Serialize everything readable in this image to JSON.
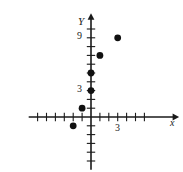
{
  "figure": {
    "kind": "scatter-plot-on-axes",
    "background_color": "#ffffff",
    "ink_color": "#1a1a1a"
  },
  "axes": {
    "x_label": "x",
    "y_label": "Y",
    "origin_px": {
      "x": 91,
      "y": 117
    },
    "unit_px": {
      "x": 8.9,
      "y": 8.8
    },
    "x_range": [
      -7,
      9
    ],
    "y_range": [
      -6,
      11
    ],
    "x_tick_labels": [
      {
        "text": "3",
        "value": 3
      }
    ],
    "y_tick_labels": [
      {
        "text": "9",
        "value": 9
      },
      {
        "text": "3",
        "value": 3
      }
    ],
    "tick_interval": 1,
    "grid": false,
    "arrowheads": [
      "x-positive",
      "y-positive"
    ]
  },
  "chart_data": {
    "type": "scatter",
    "title": "",
    "xlabel": "x",
    "ylabel": "Y",
    "xlim": [
      -7,
      9
    ],
    "ylim": [
      -6,
      11
    ],
    "xticks": [
      -6,
      -5,
      -4,
      -3,
      -2,
      -1,
      1,
      2,
      3,
      4,
      5,
      6
    ],
    "yticks": [
      -5,
      -4,
      -3,
      -2,
      -1,
      1,
      2,
      3,
      4,
      5,
      6,
      7,
      8,
      9,
      10
    ],
    "xtick_labels": {
      "3": "3"
    },
    "ytick_labels": {
      "3": "3",
      "9": "9"
    },
    "grid": false,
    "legend": null,
    "marker": "filled-circle",
    "marker_color": "#111111",
    "marker_radius_px": 3.4,
    "points": [
      {
        "x": -2,
        "y": -1
      },
      {
        "x": -1,
        "y": 1
      },
      {
        "x": 0,
        "y": 3
      },
      {
        "x": 0,
        "y": 5
      },
      {
        "x": 1,
        "y": 7
      },
      {
        "x": 3,
        "y": 9
      }
    ]
  }
}
